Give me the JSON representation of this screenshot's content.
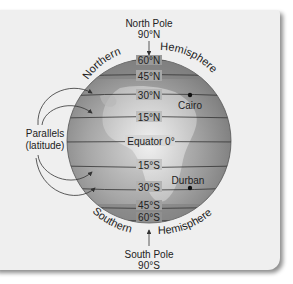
{
  "figure": {
    "north_pole": {
      "title": "North Pole",
      "value": "90°N"
    },
    "south_pole": {
      "title": "South Pole",
      "value": "90°S"
    },
    "northern_hemisphere": {
      "word1": "Northern",
      "word2": "Hemisphere"
    },
    "southern_hemisphere": {
      "word1": "Southern",
      "word2": "Hemisphere"
    },
    "parallels_label": {
      "line1": "Parallels",
      "line2": "(latitude)"
    },
    "latitudes": {
      "n60": "60°N",
      "n45": "45°N",
      "n30": "30°N",
      "n15": "15°N",
      "equator": "Equator 0°",
      "s15": "15°S",
      "s30": "30°S",
      "s45": "45°S",
      "s60": "60°S"
    },
    "cities": {
      "cairo": "Cairo",
      "durban": "Durban"
    },
    "colors": {
      "panel": "#efefef",
      "globe_dark": "#8a8a8a",
      "globe_light": "#cfcfcf",
      "line": "#333333"
    }
  }
}
